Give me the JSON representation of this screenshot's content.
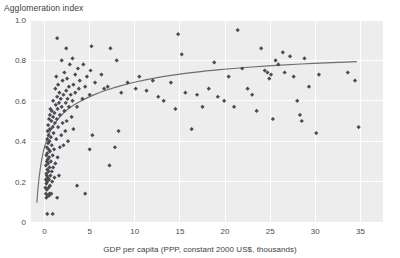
{
  "chart_data": {
    "type": "scatter",
    "title": "",
    "xlabel": "GDP per capita (PPP, constant 2000 US$, thousands)",
    "ylabel": "Agglomeration index",
    "xlim": [
      -1.5,
      37.5
    ],
    "ylim": [
      0,
      1.0
    ],
    "grid": true,
    "legend_position": "none",
    "xticks": [
      0,
      5,
      10,
      15,
      20,
      25,
      30,
      35
    ],
    "xtick_labels": [
      "0",
      "5",
      "10",
      "15",
      "20",
      "25",
      "30",
      "35"
    ],
    "yticks": [
      0,
      0.2,
      0.4,
      0.6,
      0.8,
      1.0
    ],
    "ytick_labels": [
      "0",
      "0.2",
      "0.4",
      "0.6",
      "0.8",
      "1.0"
    ],
    "series": [
      {
        "name": "countries",
        "marker": "diamond",
        "color": "#4a4a52",
        "points": [
          [
            0.3,
            0.04
          ],
          [
            0.9,
            0.04
          ],
          [
            0.2,
            0.12
          ],
          [
            0.35,
            0.13
          ],
          [
            0.5,
            0.13
          ],
          [
            0.15,
            0.14
          ],
          [
            0.55,
            0.14
          ],
          [
            0.75,
            0.14
          ],
          [
            1.4,
            0.12
          ],
          [
            0.25,
            0.16
          ],
          [
            0.1,
            0.17
          ],
          [
            0.45,
            0.17
          ],
          [
            0.2,
            0.19
          ],
          [
            0.6,
            0.18
          ],
          [
            0.3,
            0.2
          ],
          [
            0.15,
            0.21
          ],
          [
            0.5,
            0.21
          ],
          [
            0.85,
            0.2
          ],
          [
            0.35,
            0.22
          ],
          [
            0.25,
            0.23
          ],
          [
            0.65,
            0.23
          ],
          [
            1.1,
            0.22
          ],
          [
            1.6,
            0.23
          ],
          [
            0.2,
            0.24
          ],
          [
            0.45,
            0.25
          ],
          [
            0.8,
            0.25
          ],
          [
            0.3,
            0.26
          ],
          [
            0.55,
            0.27
          ],
          [
            0.15,
            0.28
          ],
          [
            0.95,
            0.27
          ],
          [
            0.4,
            0.29
          ],
          [
            0.25,
            0.3
          ],
          [
            0.7,
            0.3
          ],
          [
            1.2,
            0.29
          ],
          [
            0.35,
            0.31
          ],
          [
            0.5,
            0.32
          ],
          [
            0.2,
            0.33
          ],
          [
            0.9,
            0.33
          ],
          [
            1.45,
            0.32
          ],
          [
            0.3,
            0.34
          ],
          [
            0.6,
            0.35
          ],
          [
            0.45,
            0.36
          ],
          [
            1.05,
            0.36
          ],
          [
            0.25,
            0.37
          ],
          [
            0.8,
            0.38
          ],
          [
            1.7,
            0.37
          ],
          [
            0.4,
            0.39
          ],
          [
            2.1,
            0.38
          ],
          [
            0.55,
            0.4
          ],
          [
            0.3,
            0.41
          ],
          [
            1.3,
            0.41
          ],
          [
            2.6,
            0.4
          ],
          [
            0.7,
            0.42
          ],
          [
            0.45,
            0.43
          ],
          [
            1.0,
            0.44
          ],
          [
            1.85,
            0.43
          ],
          [
            0.35,
            0.45
          ],
          [
            2.3,
            0.45
          ],
          [
            0.6,
            0.46
          ],
          [
            0.9,
            0.47
          ],
          [
            1.5,
            0.47
          ],
          [
            3.2,
            0.46
          ],
          [
            0.4,
            0.48
          ],
          [
            1.15,
            0.49
          ],
          [
            2.0,
            0.49
          ],
          [
            0.75,
            0.5
          ],
          [
            0.5,
            0.51
          ],
          [
            1.35,
            0.51
          ],
          [
            2.45,
            0.5
          ],
          [
            0.95,
            0.52
          ],
          [
            0.6,
            0.53
          ],
          [
            1.7,
            0.53
          ],
          [
            3.0,
            0.52
          ],
          [
            1.1,
            0.54
          ],
          [
            0.8,
            0.55
          ],
          [
            2.2,
            0.55
          ],
          [
            1.45,
            0.56
          ],
          [
            0.65,
            0.56
          ],
          [
            1.9,
            0.57
          ],
          [
            2.7,
            0.57
          ],
          [
            1.25,
            0.58
          ],
          [
            3.6,
            0.57
          ],
          [
            1.6,
            0.59
          ],
          [
            2.35,
            0.59
          ],
          [
            0.95,
            0.6
          ],
          [
            3.1,
            0.6
          ],
          [
            1.8,
            0.61
          ],
          [
            2.55,
            0.61
          ],
          [
            1.4,
            0.62
          ],
          [
            4.2,
            0.61
          ],
          [
            2.1,
            0.63
          ],
          [
            2.9,
            0.63
          ],
          [
            1.65,
            0.64
          ],
          [
            3.4,
            0.64
          ],
          [
            5.0,
            0.63
          ],
          [
            2.4,
            0.65
          ],
          [
            1.2,
            0.66
          ],
          [
            3.8,
            0.66
          ],
          [
            2.7,
            0.67
          ],
          [
            4.5,
            0.67
          ],
          [
            1.5,
            0.68
          ],
          [
            3.2,
            0.68
          ],
          [
            2.0,
            0.7
          ],
          [
            5.6,
            0.69
          ],
          [
            3.9,
            0.7
          ],
          [
            2.5,
            0.71
          ],
          [
            1.3,
            0.72
          ],
          [
            4.7,
            0.72
          ],
          [
            3.4,
            0.73
          ],
          [
            6.3,
            0.73
          ],
          [
            2.2,
            0.74
          ],
          [
            5.1,
            0.75
          ],
          [
            3.7,
            0.76
          ],
          [
            2.8,
            0.78
          ],
          [
            4.3,
            0.78
          ],
          [
            1.9,
            0.8
          ],
          [
            8.0,
            0.8
          ],
          [
            3.1,
            0.81
          ],
          [
            2.4,
            0.86
          ],
          [
            7.3,
            0.86
          ],
          [
            1.4,
            0.91
          ],
          [
            5.2,
            0.87
          ],
          [
            7.2,
            0.28
          ],
          [
            7.8,
            0.37
          ],
          [
            8.2,
            0.45
          ],
          [
            5.0,
            0.36
          ],
          [
            3.6,
            0.18
          ],
          [
            4.5,
            0.14
          ],
          [
            5.3,
            0.43
          ],
          [
            6.6,
            0.66
          ],
          [
            7.0,
            0.67
          ],
          [
            8.5,
            0.64
          ],
          [
            9.2,
            0.69
          ],
          [
            10.1,
            0.66
          ],
          [
            10.5,
            0.72
          ],
          [
            11.3,
            0.65
          ],
          [
            12.0,
            0.7
          ],
          [
            12.6,
            0.62
          ],
          [
            13.2,
            0.6
          ],
          [
            14.0,
            0.69
          ],
          [
            14.5,
            0.56
          ],
          [
            14.8,
            0.93
          ],
          [
            15.2,
            0.83
          ],
          [
            15.6,
            0.64
          ],
          [
            16.3,
            0.46
          ],
          [
            16.9,
            0.63
          ],
          [
            17.5,
            0.57
          ],
          [
            18.2,
            0.66
          ],
          [
            18.8,
            0.79
          ],
          [
            19.2,
            0.62
          ],
          [
            19.9,
            0.6
          ],
          [
            20.4,
            0.72
          ],
          [
            21.0,
            0.57
          ],
          [
            21.4,
            0.95
          ],
          [
            21.9,
            0.76
          ],
          [
            22.5,
            0.66
          ],
          [
            23.0,
            0.63
          ],
          [
            23.5,
            0.55
          ],
          [
            24.0,
            0.86
          ],
          [
            24.4,
            0.75
          ],
          [
            24.7,
            0.74
          ],
          [
            24.9,
            0.71
          ],
          [
            25.1,
            0.73
          ],
          [
            25.3,
            0.51
          ],
          [
            25.6,
            0.8
          ],
          [
            25.9,
            0.78
          ],
          [
            26.4,
            0.84
          ],
          [
            26.6,
            0.74
          ],
          [
            27.2,
            0.82
          ],
          [
            27.6,
            0.72
          ],
          [
            28.0,
            0.6
          ],
          [
            28.3,
            0.53
          ],
          [
            28.5,
            0.5
          ],
          [
            28.8,
            0.81
          ],
          [
            29.3,
            0.67
          ],
          [
            30.1,
            0.44
          ],
          [
            30.4,
            0.73
          ],
          [
            33.6,
            0.74
          ],
          [
            34.4,
            0.7
          ],
          [
            34.8,
            0.47
          ]
        ]
      }
    ],
    "trendline": {
      "type": "logarithmic",
      "color": "#6e6e72",
      "points": [
        [
          -0.85,
          0.095
        ],
        [
          -0.75,
          0.155
        ],
        [
          -0.6,
          0.22
        ],
        [
          -0.4,
          0.285
        ],
        [
          -0.15,
          0.345
        ],
        [
          0.2,
          0.4
        ],
        [
          0.6,
          0.445
        ],
        [
          1.1,
          0.485
        ],
        [
          1.7,
          0.52
        ],
        [
          2.4,
          0.552
        ],
        [
          3.2,
          0.578
        ],
        [
          4.2,
          0.603
        ],
        [
          5.4,
          0.628
        ],
        [
          6.8,
          0.652
        ],
        [
          8.4,
          0.674
        ],
        [
          10.2,
          0.694
        ],
        [
          12.2,
          0.712
        ],
        [
          14.4,
          0.728
        ],
        [
          16.8,
          0.742
        ],
        [
          19.4,
          0.754
        ],
        [
          22.2,
          0.765
        ],
        [
          25.2,
          0.774
        ],
        [
          28.4,
          0.782
        ],
        [
          31.8,
          0.789
        ],
        [
          34.6,
          0.794
        ]
      ]
    }
  }
}
